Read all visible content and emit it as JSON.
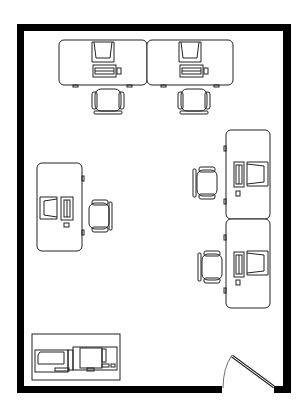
{
  "diagram": {
    "type": "office floor plan",
    "colors": {
      "wall": "#000000",
      "line": "#222222",
      "background": "#ffffff"
    },
    "room": {
      "label": "",
      "workstations": 5,
      "door": "bottom-right swing door"
    },
    "elements": [
      {
        "id": "desk-top-left",
        "kind": "desk",
        "orientation": "top"
      },
      {
        "id": "desk-top-right",
        "kind": "desk",
        "orientation": "top"
      },
      {
        "id": "desk-left",
        "kind": "desk",
        "orientation": "left"
      },
      {
        "id": "desk-right-upper",
        "kind": "desk",
        "orientation": "right"
      },
      {
        "id": "desk-right-lower",
        "kind": "desk",
        "orientation": "right"
      },
      {
        "id": "equipment-cabinet",
        "kind": "printer/copier unit",
        "orientation": "bottom-left"
      },
      {
        "id": "door",
        "kind": "door",
        "orientation": "bottom-right"
      }
    ]
  }
}
